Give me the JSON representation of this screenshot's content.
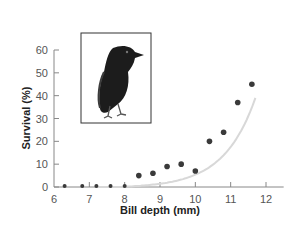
{
  "chart_data": {
    "type": "scatter",
    "title": "",
    "xlabel": "Bill depth (mm)",
    "ylabel": "Survival (%)",
    "xlim": [
      6,
      12.5
    ],
    "ylim": [
      0,
      60
    ],
    "x_ticks": [
      6,
      7,
      8,
      9,
      10,
      11,
      12
    ],
    "y_ticks": [
      0,
      10,
      20,
      30,
      40,
      50,
      60
    ],
    "grid": false,
    "legend": null,
    "series": [
      {
        "name": "Survival",
        "x": [
          6.3,
          6.8,
          7.2,
          7.6,
          8.0,
          8.4,
          8.8,
          9.2,
          9.6,
          10.0,
          10.4,
          10.8,
          11.2,
          11.6
        ],
        "y": [
          0,
          0,
          0,
          0,
          0,
          5,
          6,
          9,
          10,
          7,
          20,
          24,
          37,
          45
        ]
      }
    ],
    "trendline": {
      "type": "exponential",
      "color": "#d8d8d8"
    },
    "inset_image": "finch-illustration",
    "colors": {
      "points": "#3a3a3a",
      "axis": "#888888",
      "trend": "#d8d8d8"
    }
  }
}
